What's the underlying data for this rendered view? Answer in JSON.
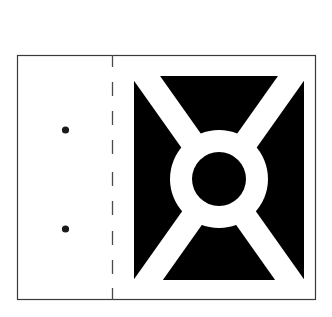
{
  "diagram": {
    "colors": {
      "background": "#ffffff",
      "frame": "#3a3a3a",
      "fold_line": "#4a4a4a",
      "emblem_fill": "#000000",
      "emblem_gap": "#ffffff",
      "hole": "#1a1a1a"
    },
    "flap": {
      "label": "",
      "hole_count": 2
    },
    "fold_line": {
      "style": "dashed"
    },
    "emblem": {
      "type": "cross-in-ring",
      "segments": [
        "top-trapezoid",
        "right-trapezoid",
        "bottom-trapezoid",
        "left-trapezoid"
      ],
      "center_mark": "filled-circle"
    }
  }
}
